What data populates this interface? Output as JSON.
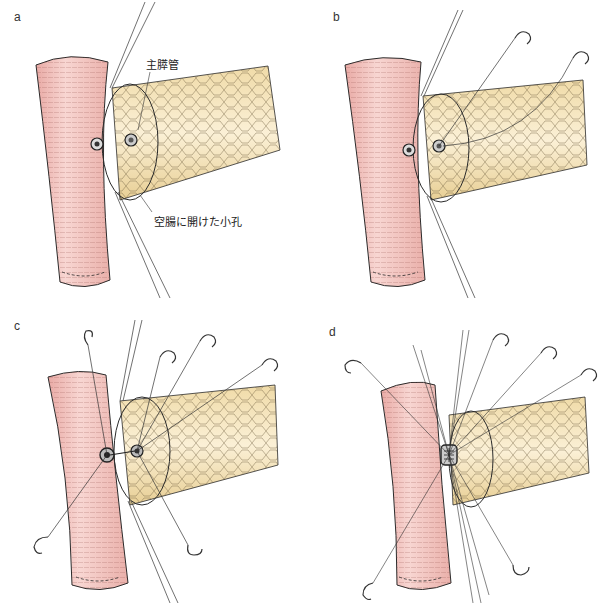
{
  "figure": {
    "panels": [
      {
        "id": "a",
        "label": "a"
      },
      {
        "id": "b",
        "label": "b"
      },
      {
        "id": "c",
        "label": "c"
      },
      {
        "id": "d",
        "label": "d"
      }
    ],
    "annotations": {
      "main_pancreatic_duct": "主膵管",
      "jejunal_hole": "空腸に開けた小孔"
    },
    "colors": {
      "jejunum": "#f4c9c4",
      "jejunum_shade": "#e8a8a2",
      "pancreas": "#f7e6c0",
      "pancreas_shade": "#ead29a",
      "line": "#2a2a2a"
    }
  }
}
